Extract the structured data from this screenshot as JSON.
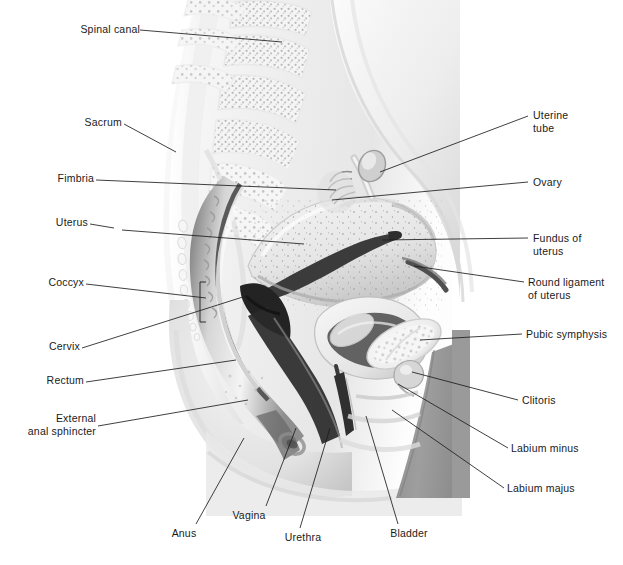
{
  "figure": {
    "background_color": "#ffffff",
    "ink_color": "#1d1d1d",
    "palette": {
      "paper": "#ffffff",
      "body_pale": "#f2f2f2",
      "soft_tissue": "#e3e3e3",
      "muscle_mid": "#c8c8c8",
      "thigh_gray": "#9a9a9a",
      "shadow_dark": "#5a5a5a",
      "cavity_black": "#2b2b2b",
      "bone_light": "#f7f7f7",
      "trabecular": "#bdbdbd"
    }
  },
  "labels": {
    "left": [
      {
        "id": "spinal-canal",
        "text": "Spinal canal",
        "x": 82,
        "y": 28,
        "lines": 1
      },
      {
        "id": "sacrum",
        "text": "Sacrum",
        "x": 68,
        "y": 121,
        "lines": 1
      },
      {
        "id": "fimbria",
        "text": "Fimbria",
        "x": 45,
        "y": 174,
        "lines": 1
      },
      {
        "id": "uterus",
        "text": "Uterus",
        "x": 42,
        "y": 218,
        "lines": 1
      },
      {
        "id": "coccyx",
        "text": "Coccyx",
        "x": 26,
        "y": 278,
        "lines": 1
      },
      {
        "id": "cervix",
        "text": "Cervix",
        "x": 34,
        "y": 345,
        "lines": 1
      },
      {
        "id": "rectum",
        "text": "Rectum",
        "x": 31,
        "y": 379,
        "lines": 1
      },
      {
        "id": "external-anal-sphincter",
        "text": "External\nanal sphincter",
        "x": 14,
        "y": 414,
        "lines": 2
      }
    ],
    "right": [
      {
        "id": "uterine-tube",
        "text": "Uterine\ntube",
        "x": 533,
        "y": 113,
        "lines": 2
      },
      {
        "id": "ovary",
        "text": "Ovary",
        "x": 533,
        "y": 179,
        "lines": 1
      },
      {
        "id": "fundus-of-uterus",
        "text": "Fundus of\nuterus",
        "x": 533,
        "y": 235,
        "lines": 2
      },
      {
        "id": "round-ligament-of-uterus",
        "text": "Round ligament\nof uterus",
        "x": 528,
        "y": 279,
        "lines": 2
      },
      {
        "id": "pubic-symphysis",
        "text": "Pubic symphysis",
        "x": 527,
        "y": 330,
        "lines": 1
      },
      {
        "id": "clitoris",
        "text": "Clitoris",
        "x": 523,
        "y": 397,
        "lines": 1
      },
      {
        "id": "labium-minus",
        "text": "Labium minus",
        "x": 512,
        "y": 444,
        "lines": 1
      },
      {
        "id": "labium-majus",
        "text": "Labium majus",
        "x": 508,
        "y": 484,
        "lines": 1
      }
    ],
    "bottom": [
      {
        "id": "anus",
        "text": "Anus",
        "x": 183,
        "y": 530,
        "lines": 1
      },
      {
        "id": "vagina",
        "text": "Vagina",
        "x": 245,
        "y": 513,
        "lines": 1
      },
      {
        "id": "urethra",
        "text": "Urethra",
        "x": 278,
        "y": 535,
        "lines": 1
      },
      {
        "id": "bladder",
        "text": "Bladder",
        "x": 383,
        "y": 531,
        "lines": 1
      }
    ]
  },
  "structures": [
    "spinal canal",
    "sacrum",
    "coccyx",
    "fimbria",
    "uterine tube",
    "ovary",
    "uterus",
    "fundus of uterus",
    "round ligament of uterus",
    "cervix",
    "vagina",
    "rectum",
    "anus",
    "external anal sphincter",
    "urinary bladder",
    "urethra",
    "pubic symphysis",
    "clitoris",
    "labium minus",
    "labium majus"
  ]
}
